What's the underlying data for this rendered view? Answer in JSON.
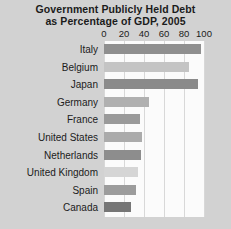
{
  "chart_data": {
    "type": "bar",
    "orientation": "horizontal",
    "title": "Government Publicly Held Debt as Percentage of GDP, 2005",
    "title_lines": [
      "Government Publicly Held Debt",
      "as Percentage of GDP, 2005"
    ],
    "xlabel": "",
    "ylabel": "",
    "xlim": [
      0,
      100
    ],
    "xticks": [
      0,
      20,
      40,
      60,
      80,
      100
    ],
    "xtick_labels": [
      "0",
      "20",
      "40",
      "60",
      "80",
      "100"
    ],
    "grid": true,
    "legend": "none",
    "categories": [
      "Italy",
      "Belgium",
      "Japan",
      "Germany",
      "France",
      "United States",
      "Netherlands",
      "United Kingdom",
      "Spain",
      "Canada"
    ],
    "values": [
      97,
      85,
      94,
      45,
      36,
      38,
      37,
      34,
      32,
      27
    ],
    "bar_colors": [
      "#8f8f8f",
      "#c4c4c4",
      "#8a8a8a",
      "#b0b0b0",
      "#9a9a9a",
      "#ababab",
      "#8d8d8d",
      "#d5d5d5",
      "#9c9c9c",
      "#767676"
    ],
    "colors": {
      "page_background": "#d2d2d2",
      "plot_background": "#fbfbfb",
      "gridline": "#d8d8d8",
      "text": "#1b1b1b"
    }
  }
}
